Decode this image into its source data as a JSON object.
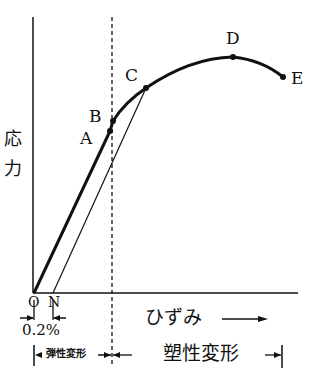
{
  "diagram": {
    "y_axis_label": [
      "応",
      "力"
    ],
    "x_axis_label": "ひずみ",
    "origin_label": "O",
    "offset_label": "N",
    "offset_value": "0.2%",
    "elastic_region_label": "弾性変形",
    "plastic_region_label": "塑性変形",
    "points": [
      {
        "label": "A",
        "x": 110,
        "y": 131
      },
      {
        "label": "B",
        "x": 113,
        "y": 121
      },
      {
        "label": "C",
        "x": 146,
        "y": 88
      },
      {
        "label": "D",
        "x": 233,
        "y": 57
      },
      {
        "label": "E",
        "x": 283,
        "y": 77
      }
    ],
    "colors": {
      "line": "#111111",
      "background": "#ffffff"
    }
  }
}
